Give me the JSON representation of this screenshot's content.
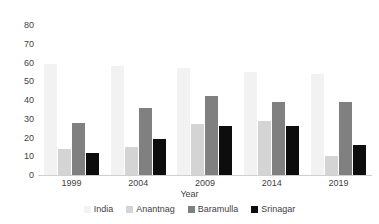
{
  "chart_data": {
    "type": "bar",
    "title": "",
    "subtitle": "",
    "xlabel": "Year",
    "ylabel": "",
    "categories": [
      "1999",
      "2004",
      "2009",
      "2014",
      "2019"
    ],
    "series": [
      {
        "name": "India",
        "color": "#F2F2F2",
        "values": [
          59,
          58,
          57,
          55,
          54
        ]
      },
      {
        "name": "Anantnag",
        "color": "#D4D4D4",
        "values": [
          14,
          15,
          27,
          29,
          10
        ]
      },
      {
        "name": "Baramulla",
        "color": "#808080",
        "values": [
          28,
          36,
          42,
          39,
          39
        ]
      },
      {
        "name": "Srinagar",
        "color": "#0D0D0D",
        "values": [
          12,
          19,
          26,
          26,
          16
        ]
      }
    ],
    "ylim": [
      0,
      80
    ],
    "ytick_step": 10,
    "yticks": [
      "80",
      "70",
      "60",
      "50",
      "40",
      "30",
      "20",
      "10",
      "0"
    ],
    "grid": false,
    "legend_position": "bottom",
    "legend_orientation": "horizontal",
    "bar_mode": "grouped"
  }
}
